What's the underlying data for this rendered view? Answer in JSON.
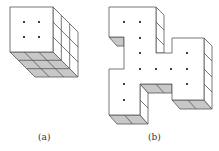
{
  "figure": {
    "subfigures": [
      {
        "id": "a",
        "caption": "(a)",
        "description": "3x3x3 cube with 4 dots on front face"
      },
      {
        "id": "b",
        "caption": "(b)",
        "description": "Polyomino-shaped prism with 12 dots on front face"
      }
    ],
    "colors": {
      "stroke": "#555555",
      "shade": "#c8c8c8",
      "face": "#ffffff",
      "dot": "#111111"
    }
  }
}
